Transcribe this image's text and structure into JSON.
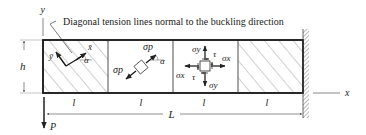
{
  "figure": {
    "annotation": "Diagonal tension lines normal to the buckling direction",
    "axes": {
      "x_label": "x",
      "y_label": "y"
    },
    "dimensions": {
      "height_label": "h",
      "panel_label": "l",
      "panel_labels": [
        "l",
        "l",
        "l",
        "l"
      ],
      "total_length_label": "L"
    },
    "load": {
      "label": "P"
    },
    "panel1": {
      "x_bar": "x̄",
      "y_bar": "ȳ",
      "angle": "α"
    },
    "panel2": {
      "sigma_p_top": "σp",
      "sigma_p_bottom": "σp",
      "angle": "α"
    },
    "panel3": {
      "sigma_y_top": "σy",
      "sigma_y_bottom": "σy",
      "sigma_x_left": "σx",
      "sigma_x_right": "σx",
      "tau_top": "τ",
      "tau_bottom": "τ"
    },
    "colors": {
      "line": "#222222",
      "hatch": "#777777",
      "background": "#ffffff"
    }
  }
}
